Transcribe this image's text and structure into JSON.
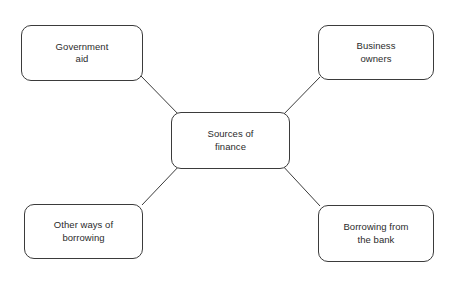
{
  "diagram": {
    "type": "mind-map",
    "title": "Sources of finance",
    "center": {
      "id": "sources-of-finance",
      "label": "Sources of\nfinance",
      "x": 171,
      "y": 112,
      "w": 119,
      "h": 57
    },
    "nodes": [
      {
        "id": "government-aid",
        "label": "Government\naid",
        "x": 21,
        "y": 25,
        "w": 122,
        "h": 56
      },
      {
        "id": "business-owners",
        "label": "Business\nowners",
        "x": 318,
        "y": 25,
        "w": 116,
        "h": 55
      },
      {
        "id": "other-ways",
        "label": "Other ways of\nborrowing",
        "x": 24,
        "y": 204,
        "w": 119,
        "h": 55
      },
      {
        "id": "borrowing-bank",
        "label": "Borrowing from\nthe bank",
        "x": 318,
        "y": 205,
        "w": 116,
        "h": 57
      }
    ],
    "connectors": [
      {
        "id": "center-to-government-aid",
        "x1": 181,
        "y1": 117,
        "x2": 141,
        "y2": 76
      },
      {
        "id": "center-to-business-owners",
        "x1": 281,
        "y1": 117,
        "x2": 320,
        "y2": 77
      },
      {
        "id": "center-to-other-ways",
        "x1": 181,
        "y1": 164,
        "x2": 142,
        "y2": 205
      },
      {
        "id": "center-to-borrowing-bank",
        "x1": 281,
        "y1": 164,
        "x2": 320,
        "y2": 206
      }
    ],
    "style": {
      "background": "#ffffff",
      "stroke": "#3b3b3b",
      "text": "#2b2b2b",
      "corner_radius": 10
    }
  }
}
